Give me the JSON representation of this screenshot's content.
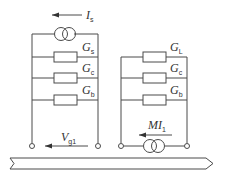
{
  "diagram": {
    "type": "equivalent-circuit",
    "left_circuit": {
      "source_label": "I",
      "source_sub": "s",
      "elements": [
        {
          "label": "G",
          "sub": "s"
        },
        {
          "label": "G",
          "sub": "c"
        },
        {
          "label": "G",
          "sub": "b"
        }
      ],
      "voltage_label": "V",
      "voltage_sub": "g1"
    },
    "right_circuit": {
      "elements": [
        {
          "label": "G",
          "sub": "L"
        },
        {
          "label": "G",
          "sub": "c"
        },
        {
          "label": "G",
          "sub": "b"
        }
      ],
      "source_label": "MI",
      "source_sub": "1"
    },
    "colors": {
      "line": "#4a4a4a",
      "background": "#ffffff"
    }
  }
}
